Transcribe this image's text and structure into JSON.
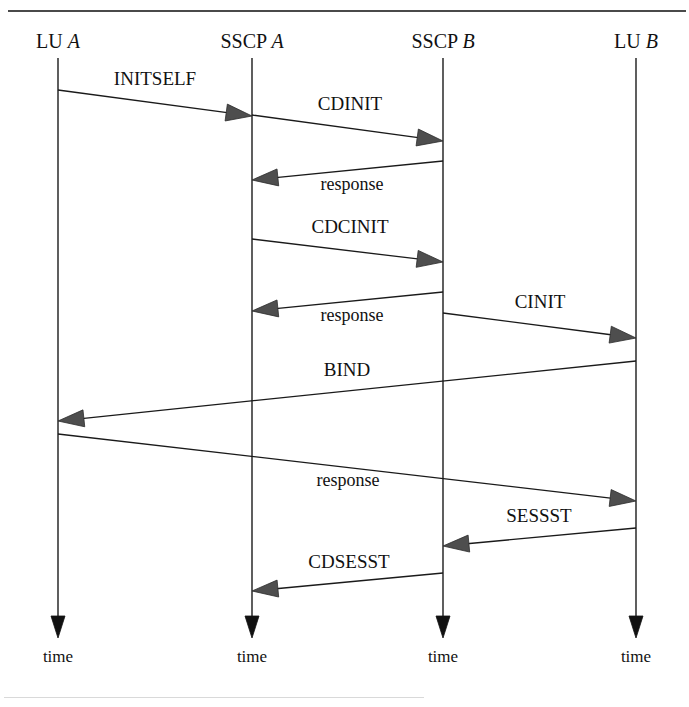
{
  "diagram": {
    "type": "sequence-diagram",
    "width": 689,
    "height": 707,
    "colors": {
      "line": "#1a1a1a",
      "arrowhead": "#4e4e4e",
      "lifeline_arrowhead": "#111111",
      "rule": "#4a4a4a",
      "background": "#ffffff"
    },
    "actors": [
      {
        "id": "lu_a",
        "prefix": "LU ",
        "italic": "A",
        "x": 58,
        "label_y": 48,
        "line_top": 58,
        "line_bottom": 616,
        "time_label": "time",
        "time_y": 662
      },
      {
        "id": "sscp_a",
        "prefix": "SSCP ",
        "italic": "A",
        "x": 252,
        "label_y": 48,
        "line_top": 58,
        "line_bottom": 616,
        "time_label": "time",
        "time_y": 662
      },
      {
        "id": "sscp_b",
        "prefix": "SSCP ",
        "italic": "B",
        "x": 443,
        "label_y": 48,
        "line_top": 58,
        "line_bottom": 616,
        "time_label": "time",
        "time_y": 662
      },
      {
        "id": "lu_b",
        "prefix": "LU ",
        "italic": "B",
        "x": 636,
        "label_y": 48,
        "line_top": 58,
        "line_bottom": 616,
        "time_label": "time",
        "time_y": 662
      }
    ],
    "messages": [
      {
        "id": "m1",
        "label": "INITSELF",
        "from": "lu_a",
        "to": "sscp_a",
        "x1": 58,
        "y1": 90,
        "x2": 252,
        "y2": 116,
        "label_x": 155,
        "label_y": 85,
        "size": "normal"
      },
      {
        "id": "m2",
        "label": "CDINIT",
        "from": "sscp_a",
        "to": "sscp_b",
        "x1": 252,
        "y1": 115,
        "x2": 443,
        "y2": 141,
        "label_x": 350,
        "label_y": 110,
        "size": "normal"
      },
      {
        "id": "m3",
        "label": "response",
        "from": "sscp_b",
        "to": "sscp_a",
        "x1": 443,
        "y1": 161,
        "x2": 252,
        "y2": 180,
        "label_x": 352,
        "label_y": 190,
        "size": "lower"
      },
      {
        "id": "m4",
        "label": "CDCINIT",
        "from": "sscp_a",
        "to": "sscp_b",
        "x1": 252,
        "y1": 239,
        "x2": 443,
        "y2": 262,
        "label_x": 350,
        "label_y": 233,
        "size": "normal"
      },
      {
        "id": "m5",
        "label": "response",
        "from": "sscp_b",
        "to": "sscp_a",
        "x1": 443,
        "y1": 292,
        "x2": 252,
        "y2": 311,
        "label_x": 352,
        "label_y": 321,
        "size": "lower"
      },
      {
        "id": "m6",
        "label": "CINIT",
        "from": "sscp_b",
        "to": "lu_b",
        "x1": 443,
        "y1": 313,
        "x2": 636,
        "y2": 338,
        "label_x": 540,
        "label_y": 308,
        "size": "normal"
      },
      {
        "id": "m7",
        "label": "BIND",
        "from": "lu_b",
        "to": "lu_a",
        "x1": 636,
        "y1": 361,
        "x2": 58,
        "y2": 421,
        "label_x": 347,
        "label_y": 376,
        "size": "normal"
      },
      {
        "id": "m8",
        "label": "response",
        "from": "lu_a",
        "to": "lu_b",
        "x1": 58,
        "y1": 434,
        "x2": 636,
        "y2": 501,
        "label_x": 348,
        "label_y": 486,
        "size": "lower"
      },
      {
        "id": "m9",
        "label": "SESSST",
        "from": "lu_b",
        "to": "sscp_b",
        "x1": 636,
        "y1": 528,
        "x2": 443,
        "y2": 546,
        "label_x": 539,
        "label_y": 522,
        "size": "normal"
      },
      {
        "id": "m10",
        "label": "CDSESST",
        "from": "sscp_b",
        "to": "sscp_a",
        "x1": 443,
        "y1": 573,
        "x2": 252,
        "y2": 591,
        "label_x": 349,
        "label_y": 568,
        "size": "normal"
      }
    ]
  }
}
